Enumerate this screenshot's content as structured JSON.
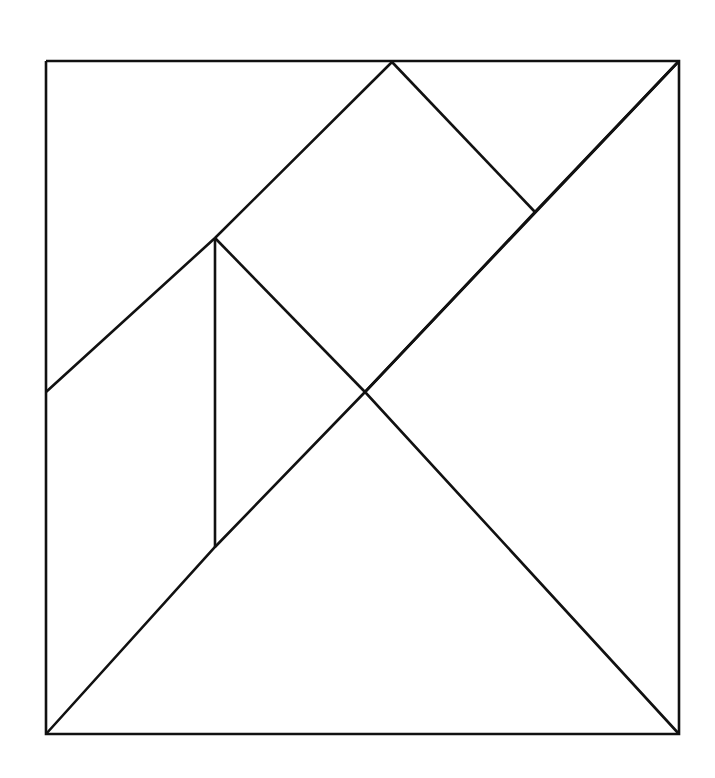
{
  "document": {
    "title": "Tangram Dissection Figure",
    "background_color": "#ffffff",
    "stroke_color": "#111111",
    "canvas_width": 715,
    "canvas_height": 778
  },
  "figure": {
    "type": "tangram-dissection",
    "shape": "square",
    "piece_count": 7,
    "stroke_width": 2.6,
    "vertices": {
      "top_left": [
        46,
        61
      ],
      "top_right": [
        679,
        61
      ],
      "bottom_right": [
        679,
        734
      ],
      "bottom_left": [
        46,
        734
      ],
      "top_apex": [
        392,
        62
      ],
      "left_mid": [
        46,
        392
      ],
      "right_notch": [
        535,
        212
      ],
      "center": [
        365,
        392
      ],
      "upper_junction": [
        215,
        238
      ],
      "vertical_bottom": [
        215,
        547
      ]
    },
    "outline": {
      "name": "outer-square",
      "points": "46,61 679,61 679,734 46,734 46,61"
    },
    "cuts": [
      {
        "name": "main-diagonal-tr-to-bl",
        "description": "Long diagonal from top-right corner through the right notch and center to the bottom-left corner",
        "points": "679,61 535,212 365,392 215,547 46,734"
      },
      {
        "name": "diagonal-tr-to-br",
        "description": "Diagonal from top-right corner down-left through center to bottom-right corner",
        "points": "679,61 365,392 679,734"
      },
      {
        "name": "apex-to-left-edge",
        "description": "Line from the top apex down-left through the upper junction to the left edge midpoint",
        "points": "392,62 215,238 46,392"
      },
      {
        "name": "apex-to-right-notch",
        "description": "Line from the top apex down-right to the right notch vertex",
        "points": "392,62 535,212"
      },
      {
        "name": "junction-to-center",
        "description": "Line from the upper junction down-right to the center crossing point",
        "points": "215,238 365,392"
      },
      {
        "name": "vertical-segment",
        "description": "Vertical line from the upper junction straight down to the main diagonal",
        "points": "215,238 215,547"
      }
    ]
  }
}
